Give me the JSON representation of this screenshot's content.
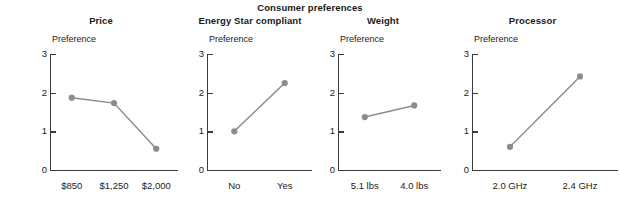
{
  "chart_data": {
    "type": "line",
    "title": "Consumer preferences",
    "ylabel": "Preference",
    "ylim": [
      0,
      3
    ],
    "yticks": [
      0,
      1,
      2,
      3
    ],
    "grid": false,
    "legend": "none",
    "marker_color": "#8c8c8c",
    "line_color": "#8c8c8c",
    "axis_color": "#3b3b3b",
    "panels": [
      {
        "title": "Price",
        "xlabel": "",
        "categories": [
          "$850",
          "$1,250",
          "$2,000"
        ],
        "values": [
          1.87,
          1.73,
          0.55
        ]
      },
      {
        "title": "Energy Star compliant",
        "xlabel": "",
        "categories": [
          "No",
          "Yes"
        ],
        "values": [
          1.0,
          2.25
        ]
      },
      {
        "title": "Weight",
        "xlabel": "",
        "categories": [
          "5.1 lbs",
          "4.0 lbs"
        ],
        "values": [
          1.37,
          1.67
        ]
      },
      {
        "title": "Processor",
        "xlabel": "",
        "categories": [
          "2.0 GHz",
          "2.4 GHz"
        ],
        "values": [
          0.6,
          2.42
        ]
      }
    ]
  },
  "figure": {
    "main_title": "Consumer preferences",
    "y_axis_caption": "Preference",
    "y_tick_labels": [
      "3",
      "2",
      "1",
      "0"
    ],
    "panel_titles": [
      "Price",
      "Energy Star compliant",
      "Weight",
      "Processor"
    ],
    "panel_1_x_labels": [
      "$850",
      "$1,250",
      "$2,000"
    ],
    "panel_2_x_labels": [
      "No",
      "Yes"
    ],
    "panel_3_x_labels": [
      "5.1 lbs",
      "4.0 lbs"
    ],
    "panel_4_x_labels": [
      "2.0 GHz",
      "2.4 GHz"
    ]
  }
}
